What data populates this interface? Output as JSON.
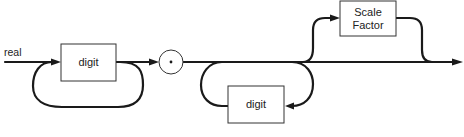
{
  "diagram": {
    "type": "syntax-diagram",
    "entry_label": "real",
    "nodes": [
      {
        "id": "digit-1",
        "kind": "nonterminal-box",
        "label": "digit"
      },
      {
        "id": "decimal-point",
        "kind": "terminal-circle",
        "label": "."
      },
      {
        "id": "digit-2",
        "kind": "nonterminal-box",
        "label": "digit"
      },
      {
        "id": "scale-factor",
        "kind": "nonterminal-box",
        "label": "Scale Factor",
        "label_lines": [
          "Scale",
          "Factor"
        ]
      }
    ],
    "paths": [
      "real -> digit-1",
      "digit-1 -> digit-1 (repeat loop)",
      "digit-1 -> decimal-point",
      "decimal-point -> digit-2 (repeat loop, may be skipped)",
      "decimal-point -> scale-factor (optional)",
      "scale-factor -> exit",
      "decimal-point -> exit"
    ],
    "colors": {
      "stroke": "#1a1a1a",
      "background": "#ffffff"
    }
  }
}
